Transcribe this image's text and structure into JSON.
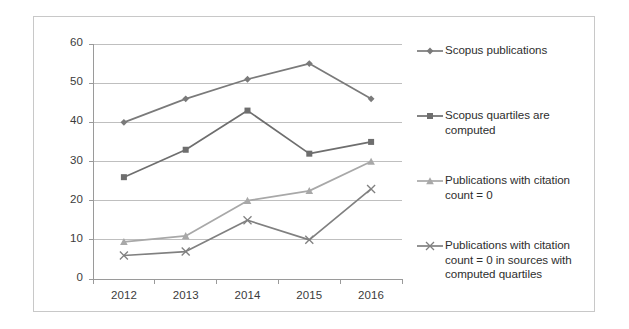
{
  "chart_data": {
    "type": "line",
    "title": "",
    "subtitle": "",
    "xlabel": "",
    "ylabel": "",
    "categories": [
      "2012",
      "2013",
      "2014",
      "2015",
      "2016"
    ],
    "ylim": [
      0,
      60
    ],
    "ytick_step": 10,
    "yticks": [
      "0",
      "10",
      "20",
      "30",
      "40",
      "50",
      "60"
    ],
    "grid": "horizontal",
    "legend_position": "right",
    "series": [
      {
        "name": "Scopus publications",
        "marker": "diamond",
        "color": "#7a7a7a",
        "values": [
          40,
          46,
          51,
          55,
          46
        ]
      },
      {
        "name": "Scopus quartiles are computed",
        "marker": "square",
        "color": "#6e6e6e",
        "values": [
          26,
          33,
          43,
          32,
          35
        ]
      },
      {
        "name": "Publications with citation count = 0",
        "marker": "triangle",
        "color": "#a8a8a8",
        "values": [
          9.5,
          11,
          20,
          22.5,
          30
        ]
      },
      {
        "name": "Publications with citation count = 0 in sources with computed quartiles",
        "marker": "x",
        "color": "#808080",
        "values": [
          6,
          7,
          15,
          10,
          23
        ]
      }
    ]
  },
  "legend": {
    "entries": [
      {
        "label": "Scopus publications",
        "marker_name": "legend-marker-diamond"
      },
      {
        "label": "Scopus quartiles are computed",
        "marker_name": "legend-marker-square"
      },
      {
        "label": "Publications with citation count = 0",
        "marker_name": "legend-marker-triangle"
      },
      {
        "label": "Publications with citation count = 0 in sources with computed quartiles",
        "marker_name": "legend-marker-x"
      }
    ]
  },
  "axes": {
    "y_tick_labels": [
      "60",
      "50",
      "40",
      "30",
      "20",
      "10",
      "0"
    ],
    "x_tick_labels": [
      "2012",
      "2013",
      "2014",
      "2015",
      "2016"
    ]
  },
  "colors": {
    "grid": "#bfbfbf",
    "axis": "#9a9a9a",
    "border": "#c8c8c8",
    "series_1": "#7a7a7a",
    "series_2": "#6e6e6e",
    "series_3": "#a8a8a8",
    "series_4": "#808080"
  }
}
